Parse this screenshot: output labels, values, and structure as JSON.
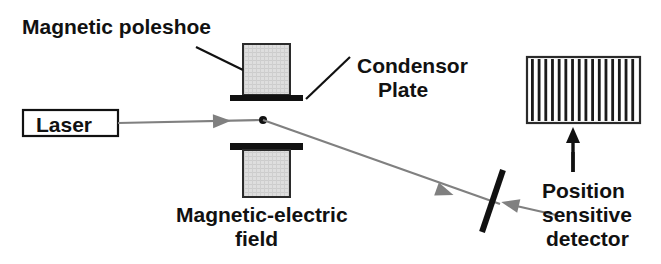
{
  "figure": {
    "background_color": "#ffffff",
    "width": 661,
    "height": 264
  },
  "labels": {
    "magnetic_poleshoe": "Magnetic poleshoe",
    "condensor_plate_line1": "Condensor",
    "condensor_plate_line2": "Plate",
    "laser": "Laser",
    "magnetic_electric_line1": "Magnetic-electric",
    "magnetic_electric_line2": "field",
    "position_detector_line1": "Position",
    "position_detector_line2": "sensitive",
    "position_detector_line3": "detector"
  },
  "colors": {
    "ink": "#111111",
    "beam": "#808080",
    "poleshoe_fill": "#d8d8d8",
    "plate": "#111111",
    "stripe": "#1b1b1b",
    "background": "#ffffff"
  },
  "components": {
    "laser_box": {
      "x": 23,
      "y": 110,
      "width": 95,
      "height": 26
    },
    "upper_poleshoe": {
      "x": 243,
      "y": 44,
      "width": 47,
      "height": 51
    },
    "upper_plate": {
      "x": 230,
      "y": 95,
      "width": 73,
      "height": 6
    },
    "lower_plate": {
      "x": 230,
      "y": 143,
      "width": 73,
      "height": 7
    },
    "lower_poleshoe": {
      "x": 243,
      "y": 150,
      "width": 47,
      "height": 47
    },
    "beam_spot": {
      "cx": 263,
      "cy": 120,
      "r": 4
    },
    "mirror": {
      "x1": 503,
      "y1": 170,
      "x2": 482,
      "y2": 232
    },
    "detector": {
      "x": 527,
      "y": 57,
      "width": 113,
      "height": 66,
      "stripe_count": 16
    },
    "detector_arrow": {
      "x": 573,
      "y_top": 127,
      "y_bottom": 172
    }
  },
  "beam_path": {
    "segment_1": {
      "x1": 118,
      "y1": 123,
      "x2": 263,
      "y2": 120,
      "arrow_at_x": 222,
      "arrow_at_y": 121
    },
    "segment_2": {
      "x1": 263,
      "y1": 120,
      "x2": 500,
      "y2": 204,
      "arrow_at_x": 445,
      "arrow_at_y": 192
    }
  },
  "leaders": {
    "poleshoe_leader": {
      "x1": 196,
      "y1": 47,
      "x2": 243,
      "y2": 70
    },
    "condensor_leader_upper": {
      "x1": 350,
      "y1": 57,
      "x2": 306,
      "y2": 99
    },
    "condensor_leader_lower": {
      "x1": 345,
      "y1": 98,
      "x2": 306,
      "y2": 99
    },
    "detector_leader": {
      "x1": 573,
      "y1": 152,
      "x2": 573,
      "y2": 172
    },
    "mirror_pointer": {
      "x1": 556,
      "y1": 215,
      "x2": 500,
      "y2": 202
    }
  },
  "text_positions": {
    "magnetic_poleshoe": {
      "x": 22,
      "y": 34
    },
    "condensor_plate_line1": {
      "x": 357,
      "y": 73
    },
    "condensor_plate_line2": {
      "x": 378,
      "y": 97
    },
    "laser": {
      "x": 36,
      "y": 132
    },
    "magnetic_electric_line1": {
      "x": 176,
      "y": 222
    },
    "magnetic_electric_line2": {
      "x": 235,
      "y": 246
    },
    "position_detector_line1": {
      "x": 542,
      "y": 198
    },
    "position_detector_line2": {
      "x": 542,
      "y": 222
    },
    "position_detector_line3": {
      "x": 546,
      "y": 246
    }
  }
}
